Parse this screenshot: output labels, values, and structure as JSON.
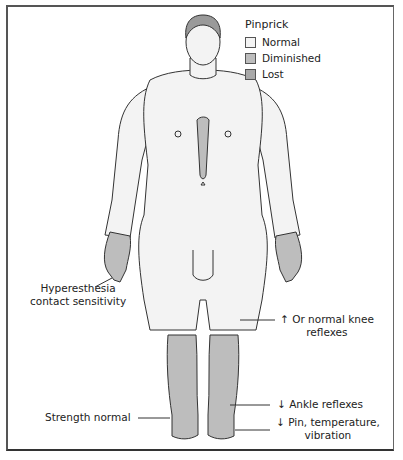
{
  "legend": {
    "title": "Pinprick",
    "items": [
      {
        "label": "Normal",
        "color": "#f4f4f4"
      },
      {
        "label": "Diminished",
        "color": "#bdbdbd"
      },
      {
        "label": "Lost",
        "color": "#a9a9a9"
      }
    ]
  },
  "annotations": {
    "hyperesthesia_line1": "Hyperesthesia",
    "hyperesthesia_line2": "contact sensitivity",
    "knee_line1": "↑ Or normal knee",
    "knee_line2": "reflexes",
    "strength": "Strength normal",
    "ankle": "↓ Ankle reflexes",
    "pin_line1": "↓ Pin, temperature,",
    "pin_line2": "vibration"
  },
  "colors": {
    "skin": "#f3f3f3",
    "diminished": "#bdbdbd",
    "outline": "#333333"
  }
}
